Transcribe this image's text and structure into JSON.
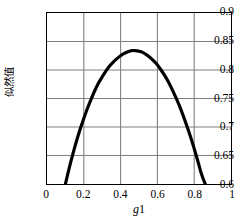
{
  "chart_data": {
    "type": "line",
    "title": "",
    "xlabel": "g1",
    "ylabel": "似然值",
    "xlim": [
      0,
      1
    ],
    "ylim": [
      0.6,
      0.9
    ],
    "grid": true,
    "legend": "none",
    "xticks": [
      "0",
      "0.2",
      "0.4",
      "0.6",
      "0.8",
      "1"
    ],
    "xtick_values": [
      0,
      0.2,
      0.4,
      0.6,
      0.8,
      1
    ],
    "yticks": [
      "0.6",
      "0.65",
      "0.7",
      "0.75",
      "0.8",
      "0.85",
      "0.9"
    ],
    "ytick_values": [
      0.6,
      0.65,
      0.7,
      0.75,
      0.8,
      0.85,
      0.9
    ],
    "series": [
      {
        "name": "likelihood",
        "color": "#000000",
        "linewidth": 3.2,
        "x": [
          0.1,
          0.12,
          0.14,
          0.16,
          0.18,
          0.2,
          0.22,
          0.24,
          0.26,
          0.28,
          0.3,
          0.32,
          0.34,
          0.36,
          0.38,
          0.4,
          0.42,
          0.44,
          0.46,
          0.48,
          0.5,
          0.52,
          0.54,
          0.56,
          0.58,
          0.6,
          0.62,
          0.64,
          0.66,
          0.68,
          0.7,
          0.72,
          0.74,
          0.76,
          0.78,
          0.8,
          0.82,
          0.84,
          0.86
        ],
        "y": [
          0.6,
          0.627,
          0.652,
          0.675,
          0.696,
          0.715,
          0.733,
          0.749,
          0.764,
          0.777,
          0.788,
          0.798,
          0.807,
          0.814,
          0.82,
          0.825,
          0.829,
          0.832,
          0.834,
          0.834,
          0.833,
          0.831,
          0.827,
          0.822,
          0.816,
          0.809,
          0.8,
          0.79,
          0.779,
          0.766,
          0.752,
          0.737,
          0.72,
          0.702,
          0.683,
          0.662,
          0.64,
          0.617,
          0.6
        ]
      }
    ],
    "annotations": {
      "peak_x": 0.47,
      "peak_y": 0.834
    }
  },
  "axes": {
    "y_title": "似然值",
    "x_title_var": "g",
    "x_title_sub": "1",
    "x_tick_labels": [
      "0",
      "0.2",
      "0.4",
      "0.6",
      "0.8",
      "1"
    ],
    "y_tick_labels": [
      "0.9",
      "0.85",
      "0.8",
      "0.75",
      "0.7",
      "0.65",
      "0.6"
    ]
  },
  "style": {
    "curve_color": "#000000",
    "grid_color": "#808080",
    "frame_color": "#000000",
    "background": "#ffffff"
  }
}
